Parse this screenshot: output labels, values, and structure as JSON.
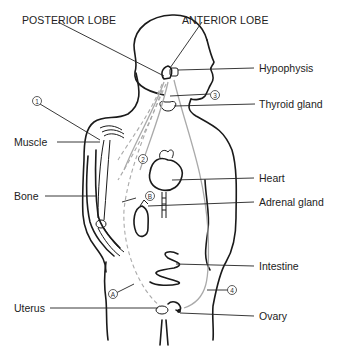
{
  "diagram": {
    "labels": {
      "posterior_lobe": "POSTERIOR LOBE",
      "anterior_lobe": "ANTERIOR LOBE",
      "hypophysis": "Hypophysis",
      "thyroid_gland": "Thyroid gland",
      "muscle": "Muscle",
      "bone": "Bone",
      "heart": "Heart",
      "adrenal_gland": "Adrenal gland",
      "intestine": "Intestine",
      "uterus": "Uterus",
      "ovary": "Ovary"
    },
    "markers": {
      "m1": "1",
      "m2": "2",
      "m3": "3",
      "m4": "4",
      "mA": "A",
      "mB": "B"
    },
    "colors": {
      "outline": "#1a1a1a",
      "pathway": "#aaaaaa",
      "text": "#222222",
      "background": "#ffffff"
    }
  }
}
